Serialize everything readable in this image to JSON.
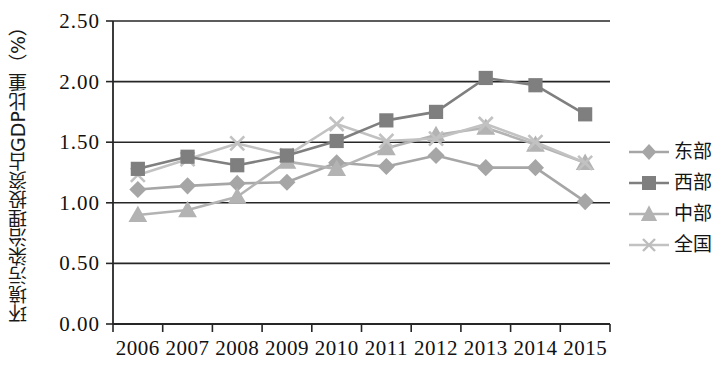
{
  "chart_data": {
    "type": "line",
    "title": "",
    "xlabel": "",
    "ylabel": "环境污染治理投资占GDP比重（%）",
    "categories": [
      "2006",
      "2007",
      "2008",
      "2009",
      "2010",
      "2011",
      "2012",
      "2013",
      "2014",
      "2015"
    ],
    "ylim": [
      0.0,
      2.5
    ],
    "ytick_labels": [
      "0.00",
      "0.50",
      "1.00",
      "1.50",
      "2.00",
      "2.50"
    ],
    "ytick_values": [
      0.0,
      0.5,
      1.0,
      1.5,
      2.0,
      2.5
    ],
    "grid": true,
    "legend_position": "right",
    "series": [
      {
        "name": "东部",
        "marker": "diamond",
        "color": "#a6a6a6",
        "values": [
          1.11,
          1.14,
          1.16,
          1.17,
          1.33,
          1.3,
          1.39,
          1.29,
          1.29,
          1.01
        ]
      },
      {
        "name": "西部",
        "marker": "square",
        "color": "#7f7f7f",
        "values": [
          1.28,
          1.38,
          1.31,
          1.39,
          1.51,
          1.68,
          1.75,
          2.03,
          1.97,
          1.73
        ]
      },
      {
        "name": "中部",
        "marker": "triangle",
        "color": "#b3b3b3",
        "values": [
          0.9,
          0.94,
          1.05,
          1.34,
          1.28,
          1.45,
          1.56,
          1.62,
          1.48,
          1.33
        ]
      },
      {
        "name": "全国",
        "marker": "x",
        "color": "#c2c2c2",
        "values": [
          1.23,
          1.36,
          1.49,
          1.39,
          1.65,
          1.51,
          1.53,
          1.65,
          1.5,
          1.33
        ]
      }
    ]
  },
  "legend": {
    "items": [
      {
        "label": "东部"
      },
      {
        "label": "西部"
      },
      {
        "label": "中部"
      },
      {
        "label": "全国"
      }
    ]
  },
  "axis": {
    "y_title": "环境污染治理投资占GDP比重（%）"
  }
}
